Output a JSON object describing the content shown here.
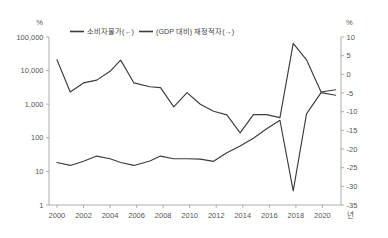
{
  "chart_data": {
    "type": "line",
    "title": "",
    "xlabel": "년",
    "x_tick_labels": [
      "2000",
      "2002",
      "2004",
      "2006",
      "2008",
      "2010",
      "2012",
      "2014",
      "2016",
      "2018",
      "2020"
    ],
    "x_ticks": [
      2000,
      2002,
      2004,
      2006,
      2008,
      2010,
      2012,
      2014,
      2016,
      2018,
      2020
    ],
    "xlim": [
      1999.4,
      2021.4
    ],
    "grid": false,
    "legend_position": "top-center",
    "axes": [
      {
        "id": "left",
        "unit": "%",
        "scale": "log",
        "ylim": [
          1,
          100000
        ],
        "tick_labels": [
          "100,000",
          "10,000",
          "1,000",
          "100",
          "10",
          "1"
        ],
        "tick_values": [
          100000,
          10000,
          1000,
          100,
          10,
          1
        ]
      },
      {
        "id": "right",
        "unit": "%",
        "scale": "linear",
        "ylim": [
          -35,
          10
        ],
        "tick_labels": [
          "10",
          "5",
          "0",
          "-5",
          "-10",
          "-15",
          "-20",
          "-25",
          "-30",
          "-35"
        ],
        "tick_values": [
          10,
          5,
          0,
          -5,
          -10,
          -15,
          -20,
          -25,
          -30,
          -35
        ]
      }
    ],
    "series": [
      {
        "name": "소비자물가(←)",
        "legend_label": "소비자물가(←)",
        "axis": "left",
        "color": "#3c3c3c",
        "x": [
          2000.0,
          2001.0,
          2002.0,
          2003.0,
          2004.0,
          2004.8,
          2005.8,
          2007.0,
          2007.8,
          2008.8,
          2009.8,
          2010.8,
          2011.8,
          2012.8,
          2013.8,
          2014.8,
          2015.8,
          2016.8,
          2017.8,
          2018.8,
          2019.9,
          2021.0
        ],
        "values": [
          21000,
          2300,
          4300,
          5200,
          9500,
          20500,
          4300,
          3300,
          3100,
          830,
          2200,
          1000,
          620,
          480,
          140,
          490,
          490,
          400,
          65000,
          21000,
          2300,
          2700
        ]
      },
      {
        "name": "(GDP 대비) 재정적자(→)",
        "legend_label": "(GDP 대비) 재정적자(→)",
        "axis": "right",
        "color": "#3c3c3c",
        "x": [
          2000.0,
          2001.0,
          2002.0,
          2003.0,
          2004.0,
          2004.8,
          2005.8,
          2007.0,
          2007.8,
          2008.8,
          2009.8,
          2010.8,
          2011.8,
          2012.8,
          2013.8,
          2014.8,
          2015.8,
          2016.8,
          2017.8,
          2018.8,
          2019.9,
          2021.0
        ],
        "values": [
          -23.6,
          -24.4,
          -23.3,
          -21.9,
          -22.6,
          -23.6,
          -24.4,
          -23.2,
          -21.9,
          -22.6,
          -22.6,
          -22.7,
          -23.3,
          -21.0,
          -19.2,
          -17.1,
          -14.6,
          -12.3,
          -31.2,
          -10.6,
          -4.9,
          -5.6
        ]
      }
    ],
    "legend": [
      {
        "label": "소비자물가(←)",
        "color": "#3c3c3c"
      },
      {
        "label": "(GDP 대비) 재정적자(→)",
        "color": "#3c3c3c"
      }
    ]
  }
}
